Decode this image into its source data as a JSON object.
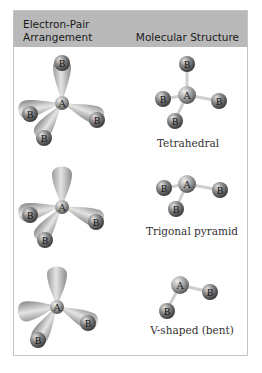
{
  "header": {
    "left_title_line1": "Electron-Pair",
    "left_title_line2": "Arrangement",
    "right_title": "Molecular Structure"
  },
  "atoms": {
    "central": "A",
    "ligand": "B"
  },
  "rows": [
    {
      "arrangement": "tetrahedral electron pairs (4 bonding)",
      "bonding_pairs": 4,
      "lone_pairs": 0,
      "structure": "Tetrahedral"
    },
    {
      "arrangement": "tetrahedral electron pairs (3 bonding, 1 lone)",
      "bonding_pairs": 3,
      "lone_pairs": 1,
      "structure": "Trigonal pyramid"
    },
    {
      "arrangement": "tetrahedral electron pairs (2 bonding, 2 lone)",
      "bonding_pairs": 2,
      "lone_pairs": 2,
      "structure": "V-shaped (bent)"
    }
  ],
  "colors": {
    "header_bg": "#b9b9b9",
    "frame_border": "#c4c4c4",
    "sphere_dark": "#4a4a4a",
    "sphere_light": "#d8d8d8",
    "lobe": "#bdbdbd"
  }
}
